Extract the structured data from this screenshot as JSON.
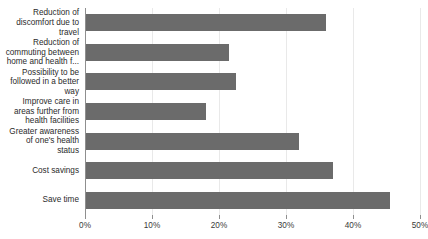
{
  "chart_data": {
    "type": "bar",
    "orientation": "horizontal",
    "title": "",
    "subtitle": "",
    "xlabel": "",
    "ylabel": "",
    "xlim": [
      0,
      50
    ],
    "xunit": "%",
    "grid": true,
    "legend": false,
    "legend_position": "none",
    "bar_color": "#6b6b6b",
    "gridline_color": "#e9e9e9",
    "axis_color": "#8f8f8f",
    "background_color": "#ffffff",
    "xticks": [
      {
        "value": 0,
        "label": "0%"
      },
      {
        "value": 10,
        "label": "10%"
      },
      {
        "value": 20,
        "label": "20%"
      },
      {
        "value": 30,
        "label": "30%"
      },
      {
        "value": 40,
        "label": "40%"
      },
      {
        "value": 50,
        "label": "50%"
      }
    ],
    "categories": [
      "Reduction of discomfort due to travel",
      "Reduction of commuting between home and health f...",
      "Possibility to be followed in a better way",
      "Improve care in areas further from health facilities",
      "Greater awareness of one's health status",
      "Cost savings",
      "Save time"
    ],
    "category_lines": [
      [
        "Reduction of",
        "discomfort due to",
        "travel"
      ],
      [
        "Reduction of",
        "commuting between",
        "home and health f..."
      ],
      [
        "Possibility to be",
        "followed in a better",
        "way"
      ],
      [
        "Improve care in",
        "areas further from",
        "health facilities"
      ],
      [
        "Greater awareness",
        "of one's health",
        "status"
      ],
      [
        "Cost savings"
      ],
      [
        "Save time"
      ]
    ],
    "values": [
      36,
      21.5,
      22.5,
      18,
      32,
      37,
      45.5
    ]
  }
}
